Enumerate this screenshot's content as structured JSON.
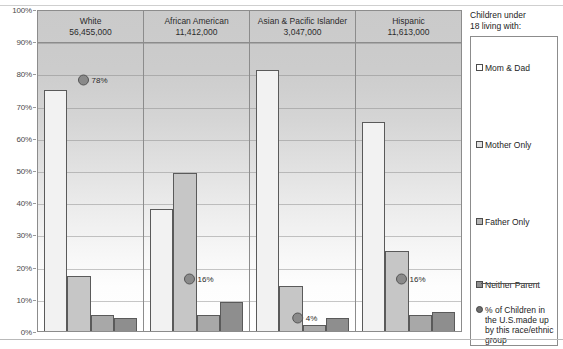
{
  "chart_data": {
    "type": "bar",
    "title": "",
    "xlabel": "",
    "ylabel": "",
    "ylim": [
      0,
      100
    ],
    "ytick_labels": [
      "100%",
      "90%",
      "80%",
      "70%",
      "60%",
      "50%",
      "40%",
      "30%",
      "20%",
      "10%",
      "0%"
    ],
    "ytick_values": [
      100,
      90,
      80,
      70,
      60,
      50,
      40,
      30,
      20,
      10,
      0
    ],
    "grid": true,
    "legend_position": "right",
    "categories": [
      "White",
      "African American",
      "Asian & Pacific Islander",
      "Hispanic"
    ],
    "category_counts": [
      "56,455,000",
      "11,412,000",
      "3,047,000",
      "11,613,000"
    ],
    "series": [
      {
        "name": "Mom & Dad",
        "values": [
          75,
          38,
          81,
          65
        ]
      },
      {
        "name": "Mother Only",
        "values": [
          17,
          49,
          14,
          25
        ]
      },
      {
        "name": "Father Only",
        "values": [
          5,
          5,
          2,
          5
        ]
      },
      {
        "name": "Neither Parent",
        "values": [
          4,
          9,
          4,
          6
        ]
      }
    ],
    "marker_series": {
      "name": "% of Children in the U.S. made up by this race/ethnic group",
      "values": [
        78,
        16,
        4,
        16
      ],
      "labels": [
        "78%",
        "16%",
        "4%",
        "16%"
      ]
    }
  },
  "legend": {
    "title_line1": "Children under",
    "title_line2": "18 living with:",
    "items": [
      {
        "label": "Mom & Dad"
      },
      {
        "label": "Mother Only"
      },
      {
        "label": "Father Only"
      },
      {
        "label": "Neither Parent"
      }
    ],
    "note": "% of Children in the U.S.made up by this race/ethnic group"
  },
  "colors": {
    "mom_dad": "#f2f2f2",
    "mother_only": "#c6c6c6",
    "father_only": "#a8a8a8",
    "neither_parent": "#8e8e8e",
    "marker": "#8a8a8a",
    "axis": "#8c8c8c",
    "text": "#2b2b2b"
  }
}
